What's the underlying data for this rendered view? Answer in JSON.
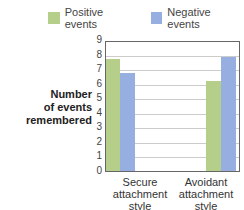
{
  "chart_data": {
    "type": "bar",
    "title": "",
    "xlabel": "",
    "ylabel": "Number of events remembered",
    "ylim": [
      0,
      9
    ],
    "yticks": [
      0,
      1,
      2,
      3,
      4,
      5,
      6,
      7,
      8,
      9
    ],
    "grid": true,
    "legend_position": "top",
    "categories": [
      "Secure attachment style",
      "Avoidant attachment style"
    ],
    "series": [
      {
        "name": "Positive events",
        "color": "#b5cf8a",
        "values": [
          7.7,
          6.2
        ]
      },
      {
        "name": "Negative events",
        "color": "#97aee0",
        "values": [
          6.7,
          7.8
        ]
      }
    ]
  },
  "legend": {
    "positive": "Positive events",
    "negative": "Negative events"
  },
  "axis": {
    "ylabel_line1": "Number",
    "ylabel_line2": "of events",
    "ylabel_line3": "remembered",
    "ticks": [
      "0",
      "1",
      "2",
      "3",
      "4",
      "5",
      "6",
      "7",
      "8",
      "9"
    ]
  },
  "categories": {
    "c1_line1": "Secure",
    "c1_line2": "attachment",
    "c1_line3": "style",
    "c2_line1": "Avoidant",
    "c2_line2": "attachment",
    "c2_line3": "style"
  }
}
